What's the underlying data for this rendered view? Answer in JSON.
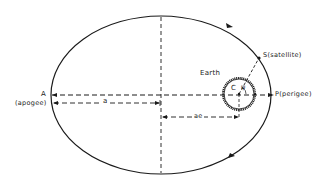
{
  "diagram": {
    "labels": {
      "apogee_point": "A",
      "apogee_text": "(apogee)",
      "perigee": "P(perigee)",
      "satellite": "S(satellite)",
      "earth": "Earth",
      "center": "C",
      "angle": "ψ",
      "semi_major": "a",
      "focal_distance": "ae"
    },
    "colors": {
      "line": "#1a1a1a",
      "background": "#ffffff"
    }
  }
}
